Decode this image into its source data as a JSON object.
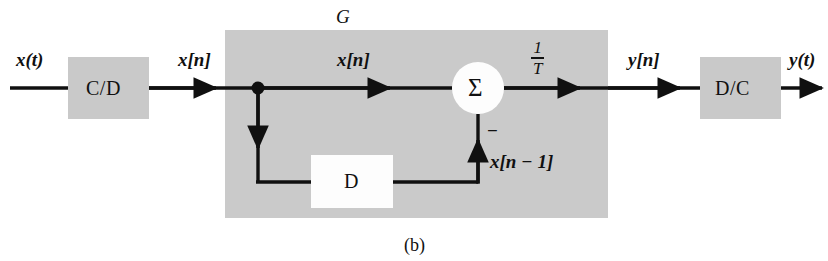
{
  "figure": {
    "caption": "(b)",
    "system_label": "G"
  },
  "blocks": [
    {
      "id": "cd",
      "label": "C/D",
      "name": "continuous-to-discrete-block"
    },
    {
      "id": "delay",
      "label": "D",
      "name": "delay-block"
    },
    {
      "id": "dc",
      "label": "D/C",
      "name": "discrete-to-continuous-block"
    }
  ],
  "summer": {
    "symbol": "Σ",
    "sign_label": "−"
  },
  "gain": {
    "numerator": "1",
    "denominator": "T"
  },
  "signals": {
    "input_continuous": "x(t)",
    "after_cd": "x[n]",
    "inside_forward": "x[n]",
    "delayed": "x[n − 1]",
    "output_discrete": "y[n]",
    "output_continuous": "y(t)"
  },
  "colors": {
    "block_fill": "#c9c9c9",
    "region_fill": "#cacaca",
    "line": "#101010",
    "background": "#ffffff",
    "white_block": "#fdfdfd"
  }
}
